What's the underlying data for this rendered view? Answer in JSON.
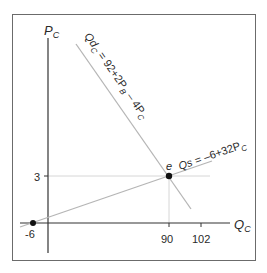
{
  "diagram": {
    "type": "supply-demand",
    "axes": {
      "y_label": "P",
      "y_label_sub": "C",
      "x_label": "Q",
      "x_label_sub": "C"
    },
    "ticks": {
      "y": [
        "3"
      ],
      "x": [
        "-6",
        "90",
        "102"
      ]
    },
    "demand": {
      "label_main": "Qd",
      "label_sub": "C",
      "label_eq": " = 92+2P",
      "label_sub2": "B",
      "label_tail": " – 4P",
      "label_sub3": "C"
    },
    "supply": {
      "label_main": "Qs",
      "label_eq": " = –6+32P",
      "label_sub": "C"
    },
    "equilibrium": {
      "label": "e",
      "q": 90,
      "p": 3
    },
    "colors": {
      "axis": "#333333",
      "curve": "#b5b5b5",
      "guide": "#d0d0d0",
      "point": "#111111",
      "frame": "#6b6b6b"
    }
  }
}
